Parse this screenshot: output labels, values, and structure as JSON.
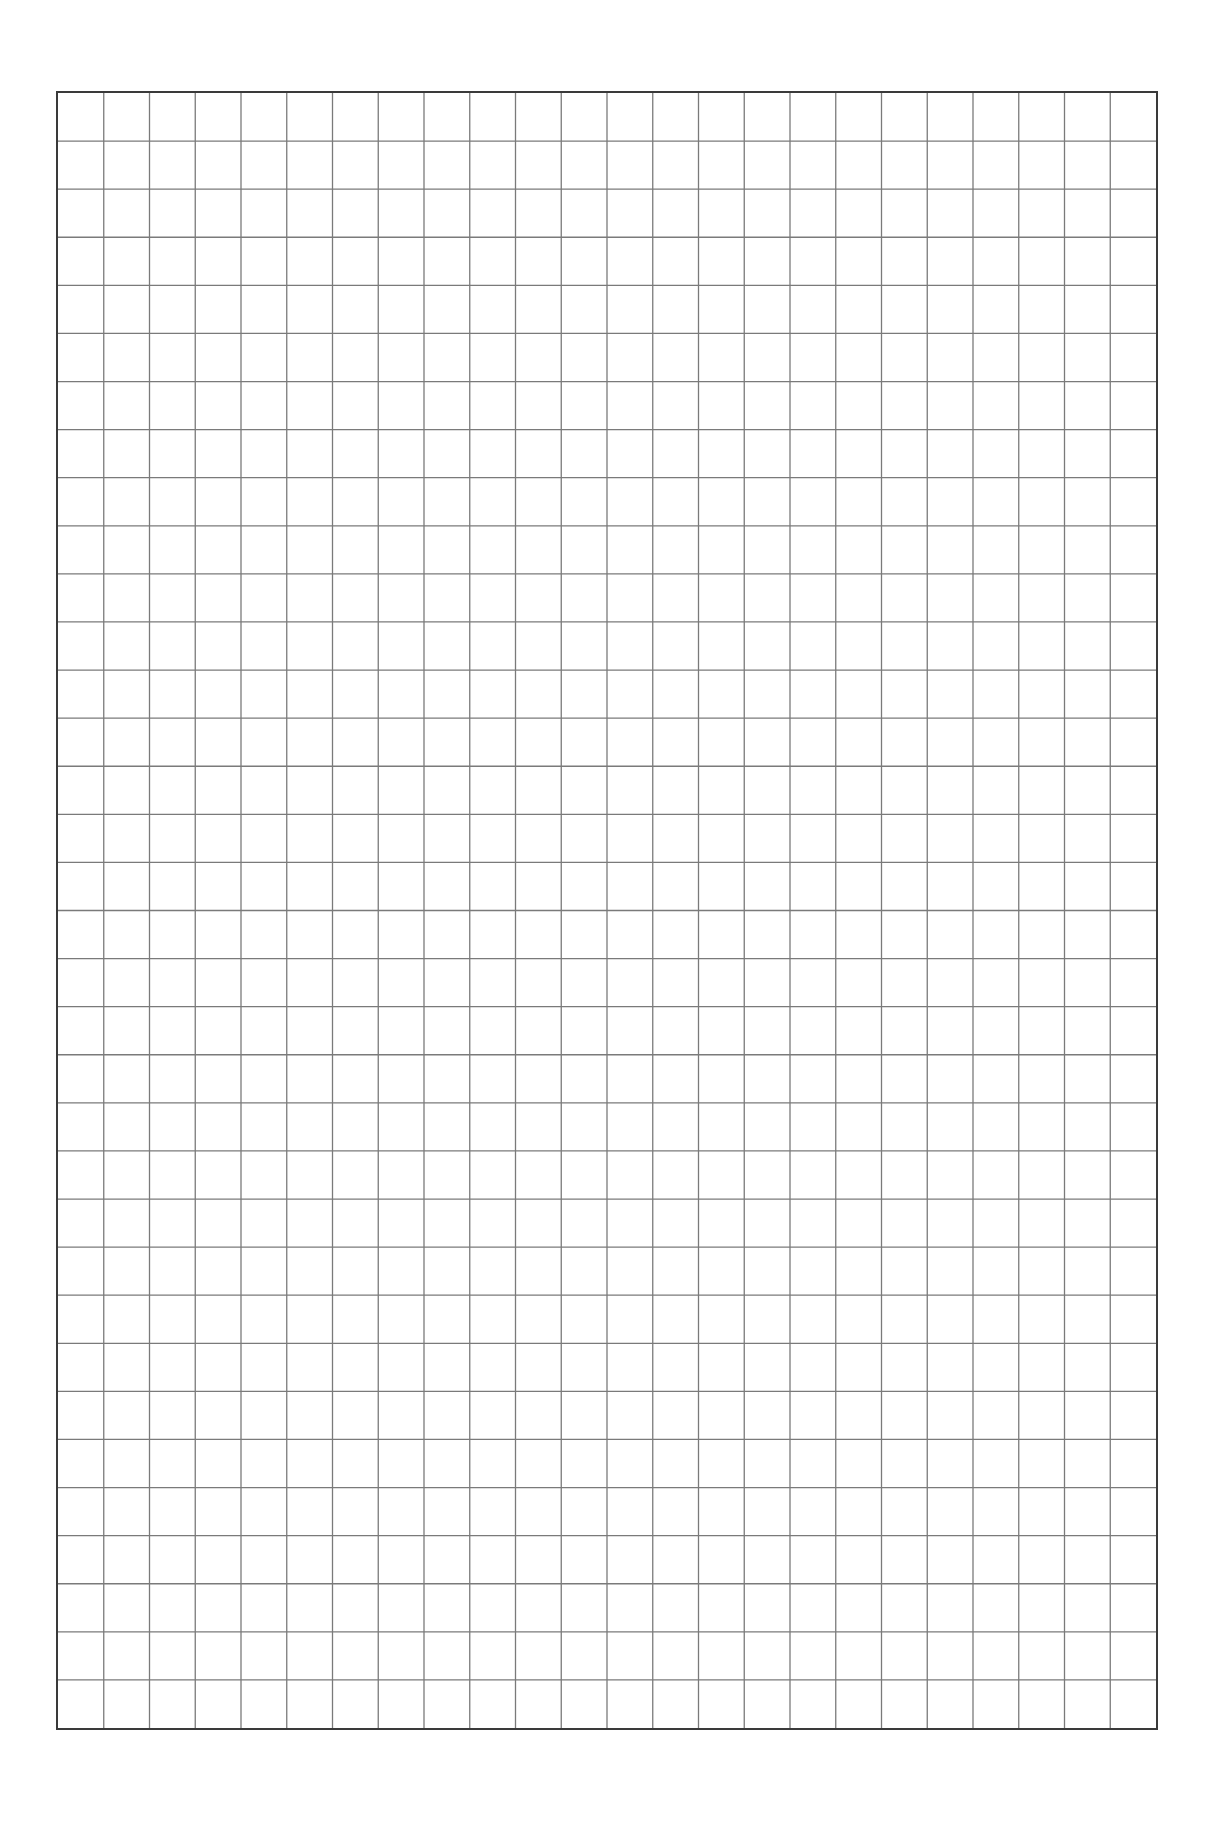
{
  "page": {
    "background": "#ffffff"
  },
  "grid": {
    "columns": 24,
    "rows": 34,
    "line_color": "#7a7a7a",
    "border_color": "#3a3a3a"
  }
}
